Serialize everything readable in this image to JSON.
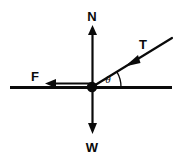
{
  "diagram": {
    "type": "free-body-force-diagram",
    "background_color": "#ffffff",
    "stroke_color": "#0a0a0a",
    "origin": {
      "x": 92,
      "y": 87,
      "dot_radius": 5
    },
    "surface_line": {
      "name": "horizontal-surface",
      "x1": 10,
      "y1": 87,
      "x2": 172,
      "y2": 87,
      "stroke_width": 3
    },
    "vectors": [
      {
        "id": "normal",
        "label": "N",
        "direction": "up",
        "x1": 92,
        "y1": 87,
        "x2": 92,
        "y2": 26,
        "label_x": 92,
        "label_y": 20
      },
      {
        "id": "weight",
        "label": "W",
        "direction": "down",
        "x1": 92,
        "y1": 87,
        "x2": 92,
        "y2": 133,
        "label_x": 92,
        "label_y": 150
      },
      {
        "id": "friction",
        "label": "F",
        "direction": "left",
        "x1": 92,
        "y1": 87,
        "x2": 46,
        "y2": 87,
        "label_x": 35,
        "label_y": 81
      },
      {
        "id": "tension",
        "label": "T",
        "direction": "up-right",
        "x1": 92,
        "y1": 87,
        "x2": 172,
        "y2": 38,
        "arrowhead_x": 131,
        "arrowhead_y": 63,
        "label_x": 142,
        "label_y": 50
      }
    ],
    "angle": {
      "symbol": "θ",
      "name": "theta",
      "between": [
        "horizontal-surface",
        "tension"
      ],
      "vertex_x": 92,
      "vertex_y": 87,
      "arc_radius": 27,
      "degrees": 31,
      "label_x": 108,
      "label_y": 82
    }
  }
}
